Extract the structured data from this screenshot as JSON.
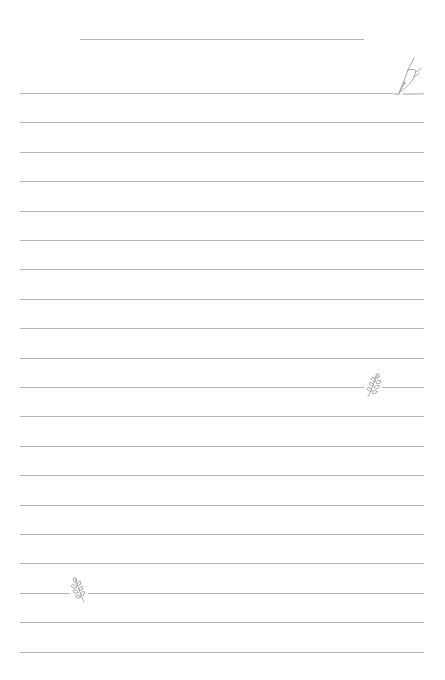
{
  "page": {
    "background": "#ffffff",
    "line_color": "#b4b4b4",
    "ornament_color": "#9a9a9a"
  },
  "title_line": {
    "x1": 80,
    "x2": 364,
    "y": 39
  },
  "ruled_lines": {
    "count": 20,
    "first_y": 93,
    "spacing": 29.4,
    "x1": 20,
    "x2": 424
  },
  "ornaments": [
    {
      "icon": "pen-nib-icon",
      "line_index": 0,
      "x": 393,
      "y": 57,
      "w": 30,
      "h": 38
    },
    {
      "icon": "leaf-sprig-icon",
      "line_index": 10,
      "x": 364,
      "y": 373,
      "w": 18,
      "h": 26
    },
    {
      "icon": "leaf-sprig-icon",
      "line_index": 17,
      "x": 70,
      "y": 577,
      "w": 18,
      "h": 26
    }
  ]
}
